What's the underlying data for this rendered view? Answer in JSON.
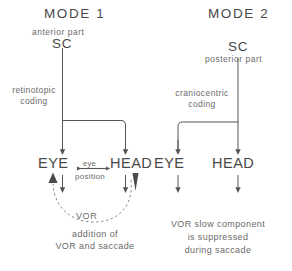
{
  "figure": {
    "kind": "neuroscience-schematic",
    "line_color": "#555555",
    "text_color": "#5a5a5a",
    "background": "#ffffff"
  },
  "mode1": {
    "title": "MODE 1",
    "source_qualifier": "anterior part",
    "source": "SC",
    "coding_line1": "retinotopic",
    "coding_line2": "coding",
    "effector_left": "EYE",
    "effector_right": "HEAD",
    "link_label_top": "eye",
    "link_label_bottom": "position",
    "arc_label": "VOR",
    "caption_line1": "addition of",
    "caption_line2": "VOR and saccade"
  },
  "mode2": {
    "title": "MODE 2",
    "source": "SC",
    "source_qualifier": "posterior part",
    "coding_line1": "craniocentric",
    "coding_line2": "coding",
    "effector_left": "EYE",
    "effector_right": "HEAD",
    "caption_line1": "VOR slow component",
    "caption_line2": "is suppressed",
    "caption_line3": "during saccade"
  },
  "footer": {
    "caption": ""
  }
}
